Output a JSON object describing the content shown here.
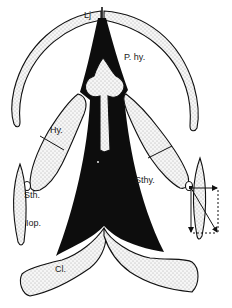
{
  "figure": {
    "type": "anatomical-diagram",
    "colors": {
      "background": "#ffffff",
      "stroke": "#111111",
      "solid_fill": "#0d0d0d",
      "stipple_fill": "#f4f4f4",
      "stipple_dot": "#6a6a6a"
    },
    "labels": {
      "lower_jaw": "Lj",
      "parahyal": "P. hy.",
      "hyoid": "Hy.",
      "stylohyal": "Sth.",
      "interopercle": "Iop.",
      "sternohyoideus": "Sthy.",
      "cleithrum": "Cl."
    },
    "annotations": {
      "force_vector_diagram": "parallelogram of forces at right hyoid joint",
      "arrows": [
        "horizontal-right",
        "vertical-down",
        "diagonal-resultant"
      ]
    }
  }
}
